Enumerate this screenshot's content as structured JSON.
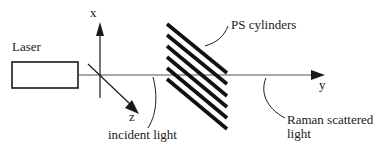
{
  "diagram": {
    "title": "",
    "labels": {
      "laser": "Laser",
      "ps_cylinders": "PS cylinders",
      "incident_light": "incident light",
      "raman_line1": "Raman scattered",
      "raman_line2": "light"
    },
    "axes": {
      "x": "x",
      "y": "y",
      "z": "z"
    },
    "cylinder_count": 6,
    "colors": {
      "ink": "#1a1a1a",
      "beam": "#555555",
      "background": "#ffffff"
    }
  }
}
